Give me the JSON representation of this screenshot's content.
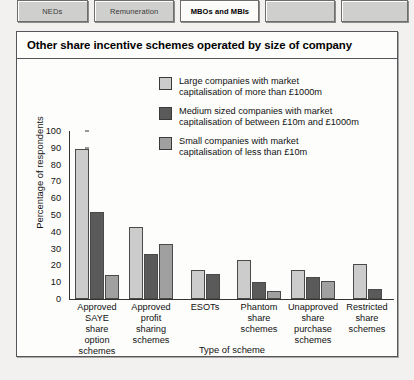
{
  "tabs": [
    {
      "label": "NEDs",
      "active": false
    },
    {
      "label": "Remuneration",
      "active": false
    },
    {
      "label": "MBOs and MBIs",
      "active": true
    },
    {
      "label": "",
      "active": false
    },
    {
      "label": "",
      "active": false
    }
  ],
  "panel": {
    "title": "Other share incentive schemes operated by size of company"
  },
  "colors": {
    "large": "#cccccc",
    "medium": "#5a5a5a",
    "small": "#a0a0a0",
    "axis": "#333333",
    "panel_border": "#55555a",
    "panel_background": "#fdfdfc",
    "page_background": "#f2f1ef"
  },
  "chart_data": {
    "type": "bar",
    "title": "Other share incentive schemes operated by size of company",
    "xlabel": "Type of scheme",
    "ylabel": "Percentage of respondents",
    "ylim": [
      0,
      100
    ],
    "yticks": [
      0,
      10,
      20,
      30,
      40,
      50,
      60,
      70,
      80,
      90,
      100
    ],
    "grid": false,
    "legend_position": "top-right",
    "categories": [
      "Approved SAYE share option schemes",
      "Approved profit sharing schemes",
      "ESOTs",
      "Phantom share schemes",
      "Unapproved share purchase schemes",
      "Restricted share schemes"
    ],
    "category_lines": [
      [
        "Approved",
        "SAYE",
        "share",
        "option",
        "schemes"
      ],
      [
        "Approved",
        "profit",
        "sharing",
        "schemes"
      ],
      [
        "ESOTs"
      ],
      [
        "Phantom",
        "share",
        "schemes"
      ],
      [
        "Unapproved",
        "share",
        "purchase",
        "schemes"
      ],
      [
        "Restricted",
        "share",
        "schemes"
      ]
    ],
    "series": [
      {
        "name": "Large companies with market capitalisation of more than £1000m",
        "legend_lines": [
          "Large companies with market",
          "capitalisation of more than £1000m"
        ],
        "color": "#cccccc",
        "values": [
          89,
          43,
          17,
          23,
          17,
          21
        ]
      },
      {
        "name": "Medium sized companies with market capitalisation of between £10m and £1000m",
        "legend_lines": [
          "Medium sized companies with market",
          "capitalisation of between £10m and £1000m"
        ],
        "color": "#5a5a5a",
        "values": [
          52,
          27,
          15,
          10,
          13,
          6
        ]
      },
      {
        "name": "Small companies with market capitalisation of less than £10m",
        "legend_lines": [
          "Small companies with market",
          "capitalisation of less than £10m"
        ],
        "color": "#a0a0a0",
        "values": [
          14,
          33,
          null,
          5,
          11,
          null
        ]
      }
    ]
  }
}
